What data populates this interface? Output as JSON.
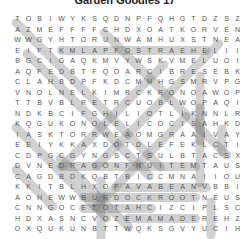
{
  "title": "Garden Goodies 17",
  "grid": [
    "TOBIWYKSQDNPFQHGTDZSZ",
    "AZMEFFFFCHDXOATKORVEN",
    "WWGYHTORUNWAMHUXSTNEA",
    "EIFTKMLAPFOSTRAEHELII",
    "BGCIGAQKMVYWSKVMELUOI",
    "AQFEDBTFQOARCIBRESEBK",
    "CLAHBDPFKDCMHHGSMRVPG",
    "VNOLNELKIMRCKRONOAWOP",
    "TTBVBLRETRCUOBLWOPAQI",
    "NDKBCIFGHILIOTLIKNNLR",
    "KQGUKONOLELICOCISAHKD",
    "IASKTORRWEAOMGRAAIVAY",
    "EEIYKKAXDOTDLEFEKLCTI",
    "CDPGCGYNGSCTSULBTACSX",
    "DVNEDRAGONFRUITEMTAUS",
    "CAGDBDKQBTBICCMNAIIOU",
    "KKITBLHXOFAVABEANVBBI",
    "AOHEWWBURDOCKROOTNEUS",
    "CNNGOCETOTAHCIZCIPLSC",
    "HDXASNCVOZEMAMADEREHZ",
    "OXQUKUNBTTWQKSGVYUCIH"
  ],
  "found_words": [
    "DRAGONFRUIT",
    "BURDOCKROOT",
    "FAVABEAN",
    "EDAMAME",
    "CHATOTE",
    "OSTRAEHEL",
    "KMLAPF"
  ],
  "highlights": [
    {
      "row": 3,
      "col": 4,
      "len": 14,
      "angle": 0
    },
    {
      "row": 14,
      "col": 4,
      "len": 13,
      "angle": 0
    },
    {
      "row": 16,
      "col": 9,
      "len": 9,
      "angle": 0
    },
    {
      "row": 17,
      "col": 6,
      "len": 11,
      "angle": 0
    },
    {
      "row": 18,
      "col": 6,
      "len": 7,
      "angle": 0
    },
    {
      "row": 19,
      "col": 10,
      "len": 7,
      "angle": 0
    },
    {
      "row": 5,
      "col": 17,
      "len": 7,
      "angle": 90
    },
    {
      "row": 8,
      "col": 17,
      "len": 8,
      "angle": 90
    },
    {
      "row": 15,
      "col": 8,
      "len": 7,
      "angle": 90
    },
    {
      "row": 17,
      "col": 18,
      "len": 4,
      "angle": 90
    },
    {
      "row": 10,
      "col": 19,
      "len": 3,
      "angle": 90
    },
    {
      "row": 0,
      "col": 0,
      "len": 14,
      "angle": 45
    },
    {
      "row": 3,
      "col": 1,
      "len": 12,
      "angle": 45
    },
    {
      "row": 1,
      "col": 8,
      "len": 12,
      "angle": 45
    },
    {
      "row": 10,
      "col": 0,
      "len": 9,
      "angle": 45
    },
    {
      "row": 13,
      "col": 4,
      "len": 7,
      "angle": 45
    },
    {
      "row": 14,
      "col": 0,
      "len": 4,
      "angle": 45
    },
    {
      "row": 2,
      "col": 19,
      "len": 12,
      "angle": 135
    },
    {
      "row": 4,
      "col": 14,
      "len": 10,
      "angle": 135
    },
    {
      "row": 9,
      "col": 16,
      "len": 9,
      "angle": 135
    }
  ]
}
